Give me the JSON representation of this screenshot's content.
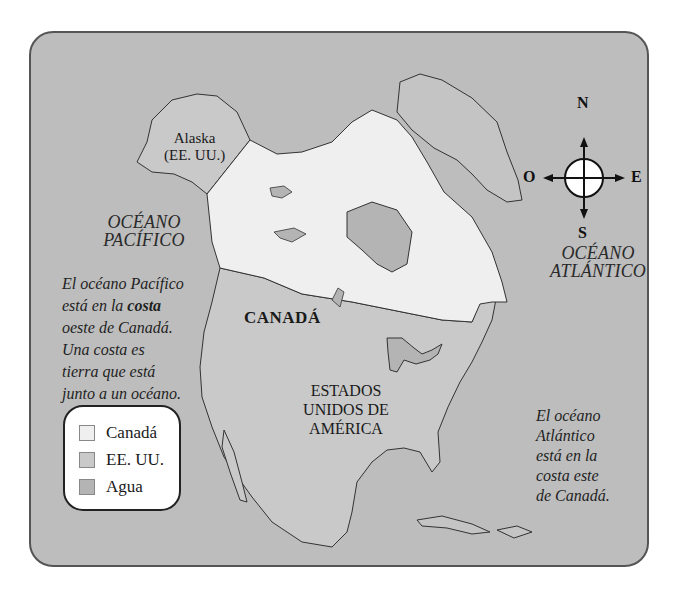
{
  "map": {
    "colors": {
      "canada": "#efefef",
      "usa": "#c9c9c9",
      "water": "#b4b4b4",
      "border": "#333333",
      "panel_border": "#555555"
    },
    "labels": {
      "alaska_line1": "Alaska",
      "alaska_line2": "(EE. UU.)",
      "pacific_line1": "OCÉANO",
      "pacific_line2": "PACÍFICO",
      "atlantic_line1": "OCÉANO",
      "atlantic_line2": "ATLÁNTICO",
      "canada": "CANADÁ",
      "usa_line1": "ESTADOS",
      "usa_line2": "UNIDOS DE",
      "usa_line3": "AMÉRICA"
    },
    "pacific_note": {
      "line1": "El océano Pacífico",
      "line2_pre": "está en la ",
      "line2_bold": "costa",
      "line3": "oeste de Canadá.",
      "line4": "Una costa es",
      "line5": "tierra que está",
      "line6": "junto a un océano."
    },
    "atlantic_note": {
      "line1": "El océano",
      "line2": "Atlántico",
      "line3": "está en la",
      "line4": "costa este",
      "line5": "de Canadá."
    },
    "compass": {
      "north": "N",
      "south": "S",
      "east": "E",
      "west": "O",
      "icon": "compass-rose-icon"
    },
    "legend": {
      "items": [
        {
          "label": "Canadá",
          "color": "#efefef"
        },
        {
          "label": "EE. UU.",
          "color": "#c9c9c9"
        },
        {
          "label": "Agua",
          "color": "#b4b4b4"
        }
      ]
    }
  }
}
